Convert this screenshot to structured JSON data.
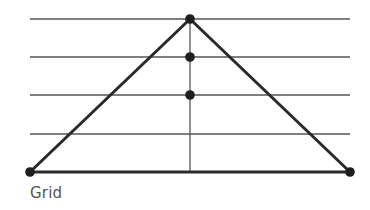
{
  "caption": "Grid",
  "colors": {
    "background": "#ffffff",
    "grid_line": "#555555",
    "triangle": "#2a2a2a",
    "dot": "#1e1e1e",
    "caption": "#555555"
  },
  "diagram": {
    "grid_lines_y": [
      19,
      57,
      95,
      134
    ],
    "grid_x_range": [
      30,
      350
    ],
    "base": {
      "y": 172,
      "x1": 30,
      "x2": 350
    },
    "vertical_axis": {
      "x": 190,
      "y1": 19,
      "y2": 172
    },
    "triangle": {
      "apex": [
        190,
        19
      ],
      "left": [
        30,
        172
      ],
      "right": [
        350,
        172
      ]
    },
    "points": [
      {
        "name": "apex",
        "x": 190,
        "y": 19
      },
      {
        "name": "mid-upper",
        "x": 190,
        "y": 57
      },
      {
        "name": "mid-lower",
        "x": 190,
        "y": 95
      },
      {
        "name": "base-left",
        "x": 30,
        "y": 172
      },
      {
        "name": "base-right",
        "x": 350,
        "y": 172
      }
    ]
  }
}
